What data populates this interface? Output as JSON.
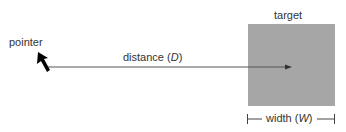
{
  "diagram": {
    "pointer_label": "pointer",
    "distance_label": "distance (",
    "distance_var": "D",
    "distance_close": ")",
    "target_label": "target",
    "width_label": "width (",
    "width_var": "W",
    "width_close": ")",
    "colors": {
      "target_fill": "#a6a6a6",
      "line": "#555555",
      "cursor": "#000000"
    }
  }
}
